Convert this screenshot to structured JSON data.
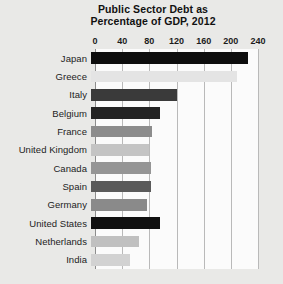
{
  "chart_data": {
    "type": "bar",
    "orientation": "horizontal",
    "title": "Public Sector Debt as Percentage of GDP, 2012",
    "title_lines": [
      "Public Sector Debt as",
      "Percentage of GDP, 2012"
    ],
    "xlabel": "",
    "ylabel": "",
    "xlim": [
      0,
      240
    ],
    "xticks": [
      0,
      40,
      80,
      120,
      160,
      200,
      240
    ],
    "xtick_labels": [
      "0",
      "40",
      "80",
      "120",
      "160",
      "200",
      "240"
    ],
    "grid": "vertical",
    "legend": "none",
    "categories": [
      "Japan",
      "Greece",
      "Italy",
      "Belgium",
      "France",
      "United Kingdom",
      "Canada",
      "Spain",
      "Germany",
      "United States",
      "Netherlands",
      "India"
    ],
    "values": [
      231,
      215,
      127,
      102,
      90,
      86,
      88,
      88,
      82,
      102,
      71,
      58
    ],
    "bars": [
      {
        "category": "Japan",
        "value": 231,
        "color": "#0d0d0d"
      },
      {
        "category": "Greece",
        "value": 215,
        "color": "#e4e4e4"
      },
      {
        "category": "Italy",
        "value": 127,
        "color": "#3a3a3a"
      },
      {
        "category": "Belgium",
        "value": 102,
        "color": "#232323"
      },
      {
        "category": "France",
        "value": 90,
        "color": "#8c8c8c"
      },
      {
        "category": "United Kingdom",
        "value": 86,
        "color": "#c4c4c4"
      },
      {
        "category": "Canada",
        "value": 88,
        "color": "#959595"
      },
      {
        "category": "Spain",
        "value": 88,
        "color": "#5a5a5a"
      },
      {
        "category": "Germany",
        "value": 82,
        "color": "#8a8a8a"
      },
      {
        "category": "United States",
        "value": 102,
        "color": "#101010"
      },
      {
        "category": "Netherlands",
        "value": 71,
        "color": "#c0c0c0"
      },
      {
        "category": "India",
        "value": 58,
        "color": "#d2d2d2"
      }
    ]
  },
  "figure": {
    "background_color": "#e9e9e7",
    "plot_background_color": "#fbfbfb",
    "gridline_color": "#b9b9b9",
    "axis_color": "#8d8d8d"
  }
}
